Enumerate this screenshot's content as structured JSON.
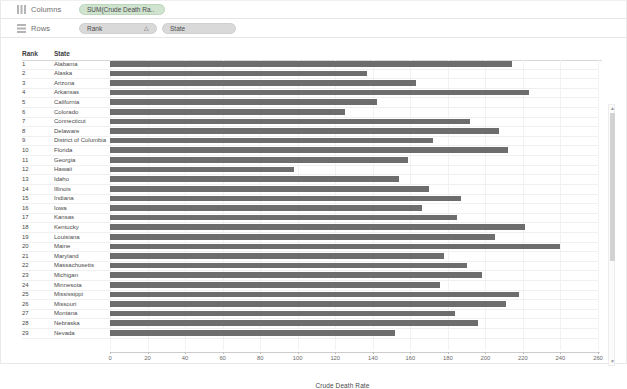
{
  "shelves": {
    "columns": {
      "label": "Columns",
      "icon": "columns-icon",
      "pills": [
        {
          "text": "SUM(Crude Death Ra..",
          "color": "#cfe3cf"
        }
      ]
    },
    "rows": {
      "label": "Rows",
      "icon": "rows-icon",
      "pills": [
        {
          "text": "Rank",
          "sort": "△"
        },
        {
          "text": "State"
        }
      ]
    }
  },
  "table": {
    "headers": {
      "rank": "Rank",
      "state": "State"
    }
  },
  "axis_title": "Crude Death Rate",
  "scrollbar": {
    "up": "▲",
    "down": "▼"
  },
  "chart_data": {
    "type": "bar",
    "orientation": "horizontal",
    "title": "",
    "xlabel": "Crude Death Rate",
    "ylabel": "",
    "xlim": [
      0,
      260
    ],
    "grid": true,
    "legend": false,
    "bar_color": "#6d6d6d",
    "xticks": [
      0,
      20,
      40,
      60,
      80,
      100,
      120,
      140,
      160,
      180,
      200,
      220,
      240,
      260
    ],
    "categories": [
      "Alabama",
      "Alaska",
      "Arizona",
      "Arkansas",
      "California",
      "Colorado",
      "Connecticut",
      "Delaware",
      "District of Columbia",
      "Florida",
      "Georgia",
      "Hawaii",
      "Idaho",
      "Illinois",
      "Indiana",
      "Iowa",
      "Kansas",
      "Kentucky",
      "Louisiana",
      "Maine",
      "Maryland",
      "Massachusetts",
      "Michigan",
      "Minnesota",
      "Mississippi",
      "Missouri",
      "Montana",
      "Nebraska",
      "Nevada"
    ],
    "ranks": [
      "1",
      "2",
      "3",
      "4",
      "5",
      "6",
      "7",
      "8",
      "9",
      "10",
      "11",
      "12",
      "13",
      "14",
      "15",
      "16",
      "17",
      "18",
      "19",
      "20",
      "21",
      "22",
      "23",
      "24",
      "25",
      "26",
      "27",
      "28",
      "29"
    ],
    "values": [
      214,
      137,
      163,
      223,
      142,
      125,
      192,
      207,
      172,
      212,
      159,
      98,
      154,
      170,
      187,
      166,
      185,
      221,
      205,
      240,
      178,
      190,
      198,
      176,
      218,
      211,
      184,
      196,
      152
    ]
  }
}
